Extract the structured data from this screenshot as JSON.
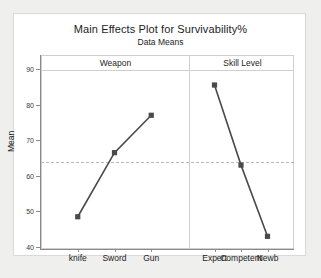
{
  "chart_data": {
    "type": "line",
    "title": "Main Effects Plot for Survivability%",
    "subtitle": "Data Means",
    "ylabel": "Mean",
    "xlabel": "",
    "ylim": [
      40,
      90
    ],
    "yticks": [
      40,
      50,
      60,
      70,
      80,
      90
    ],
    "grid": false,
    "legend": false,
    "grand_mean": 64,
    "marker": "square",
    "line_color": "#4a4a4a",
    "panels": [
      {
        "name": "Weapon",
        "categories": [
          "knife",
          "Sword",
          "Gun"
        ],
        "values": [
          48.5,
          66.5,
          77.0
        ]
      },
      {
        "name": "Skill Level",
        "categories": [
          "Expert",
          "Competent",
          "Newb"
        ],
        "values": [
          85.5,
          63.0,
          43.0
        ]
      }
    ]
  }
}
